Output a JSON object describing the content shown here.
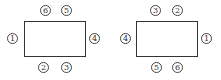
{
  "diagrams": [
    {
      "name": "left-table",
      "seats": [
        {
          "label": "6",
          "position": "top-left"
        },
        {
          "label": "5",
          "position": "top-right"
        },
        {
          "label": "1",
          "position": "left"
        },
        {
          "label": "4",
          "position": "right"
        },
        {
          "label": "2",
          "position": "bottom-left"
        },
        {
          "label": "3",
          "position": "bottom-right"
        }
      ]
    },
    {
      "name": "right-table",
      "seats": [
        {
          "label": "3",
          "position": "top-left"
        },
        {
          "label": "2",
          "position": "top-right"
        },
        {
          "label": "4",
          "position": "left"
        },
        {
          "label": "1",
          "position": "right"
        },
        {
          "label": "5",
          "position": "bottom-left"
        },
        {
          "label": "6",
          "position": "bottom-right"
        }
      ]
    }
  ],
  "colors": {
    "line": "#333333",
    "background": "#ffffff"
  }
}
